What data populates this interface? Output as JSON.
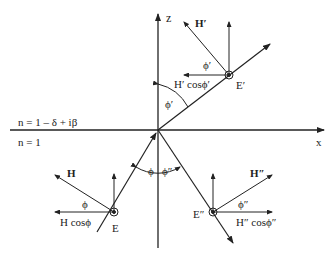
{
  "diagram": {
    "type": "ray-optics-fresnel",
    "axes": {
      "z_label": "z",
      "x_label": "x"
    },
    "media": {
      "upper": "n = 1 – δ + iβ",
      "lower": "n = 1"
    },
    "incident": {
      "field_E": "E",
      "field_H": "H",
      "angle": "ϕ",
      "projection": "H cosϕ"
    },
    "refracted": {
      "field_E": "E′",
      "field_H": "H′",
      "angle": "ϕ′",
      "projection": "H′ cosϕ′",
      "axis_angle": "ϕ′"
    },
    "reflected": {
      "field_E": "E″",
      "field_H": "H″",
      "angle": "ϕ″",
      "projection": "H″ cosϕ″"
    },
    "normal_angles": {
      "incident": "ϕ",
      "reflected": "ϕ″"
    },
    "colors": {
      "stroke": "#222222",
      "background": "#ffffff"
    }
  }
}
